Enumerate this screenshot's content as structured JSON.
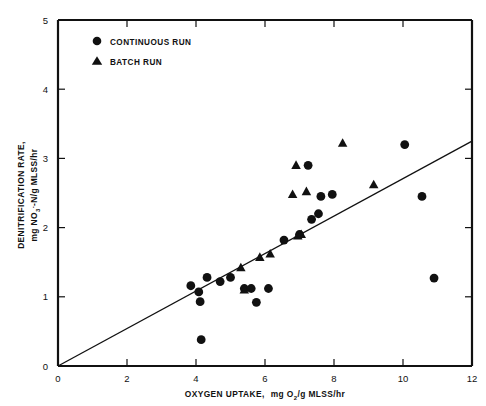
{
  "chart_data": {
    "type": "scatter",
    "title": "",
    "xlabel": "OXYGEN UPTAKE,  mg O2/g MLSS/hr",
    "ylabel": "DENITRIFICATION RATE, mg NO3-N/g MLSS/hr",
    "xlim": [
      0,
      12
    ],
    "ylim": [
      0,
      5
    ],
    "xticks": [
      0,
      2,
      4,
      6,
      8,
      10,
      12
    ],
    "yticks": [
      0,
      1,
      2,
      3,
      4,
      5
    ],
    "xtick_labels": [
      "0",
      "2",
      "4",
      "6",
      "8",
      "10",
      "12"
    ],
    "ytick_labels": [
      "0",
      "1",
      "2",
      "3",
      "4",
      "5"
    ],
    "grid": false,
    "legend_position": "top-left",
    "series": [
      {
        "name": "CONTINUOUS RUN",
        "marker": "circle",
        "color": "#111111",
        "points": [
          [
            3.85,
            1.16
          ],
          [
            4.08,
            1.07
          ],
          [
            4.12,
            0.93
          ],
          [
            4.32,
            1.28
          ],
          [
            4.15,
            0.38
          ],
          [
            4.7,
            1.22
          ],
          [
            5.0,
            1.28
          ],
          [
            5.4,
            1.12
          ],
          [
            5.6,
            1.12
          ],
          [
            5.75,
            0.92
          ],
          [
            6.1,
            1.12
          ],
          [
            6.55,
            1.82
          ],
          [
            7.0,
            1.9
          ],
          [
            7.35,
            2.12
          ],
          [
            7.55,
            2.2
          ],
          [
            7.62,
            2.45
          ],
          [
            7.95,
            2.48
          ],
          [
            7.25,
            2.9
          ],
          [
            10.05,
            3.2
          ],
          [
            10.55,
            2.45
          ],
          [
            10.9,
            1.27
          ]
        ]
      },
      {
        "name": "BATCH RUN",
        "marker": "triangle",
        "color": "#111111",
        "points": [
          [
            5.4,
            1.1
          ],
          [
            5.3,
            1.42
          ],
          [
            5.85,
            1.57
          ],
          [
            6.15,
            1.62
          ],
          [
            6.95,
            1.88
          ],
          [
            7.05,
            1.9
          ],
          [
            6.8,
            2.48
          ],
          [
            6.9,
            2.9
          ],
          [
            7.2,
            2.52
          ],
          [
            8.25,
            3.22
          ],
          [
            9.15,
            2.62
          ]
        ]
      }
    ],
    "fit_line": {
      "label": "regression line",
      "x_start": 0.0,
      "y_start": 0.0,
      "x_end": 12.0,
      "y_end": 3.25
    },
    "legend": [
      {
        "label": "CONTINUOUS RUN",
        "marker": "circle"
      },
      {
        "label": "BATCH RUN",
        "marker": "triangle"
      }
    ],
    "xlabel_parts": {
      "main": "OXYGEN UPTAKE,",
      "unit_pre": "mg O",
      "unit_sub": "2",
      "unit_post": "/g MLSS/hr"
    },
    "ylabel_parts": {
      "line1": "DENITRIFICATION RATE,",
      "line2_pre": "mg NO",
      "line2_sub": "3",
      "line2_sup": "-",
      "line2_post": "-N/g MLSS/hr"
    }
  }
}
